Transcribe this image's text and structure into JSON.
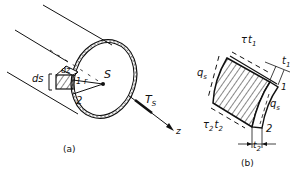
{
  "figure_a": {
    "caption": "(a)",
    "labels": {
      "ds": "ds",
      "dz": "dz",
      "r": "r",
      "shear_centre": "S",
      "point_1": "1",
      "point_2": "2",
      "torque": "T",
      "torque_sub": "S",
      "axis": "z"
    }
  },
  "figure_b": {
    "caption": "(b)",
    "labels": {
      "tau1": "τ",
      "t1_top": "t",
      "t1_top_sub": "1",
      "t1": "t",
      "t1_sub": "1",
      "qs_left": "q",
      "qs_left_sub": "s",
      "qs_right": "q",
      "qs_right_sub": "s",
      "point_1": "1",
      "point_2": "2",
      "tau2": "τ",
      "tau2_sub": "2",
      "t2_bottom": "t",
      "t2_bottom_sub": "2",
      "t2": "t",
      "t2_sub": "2"
    }
  }
}
